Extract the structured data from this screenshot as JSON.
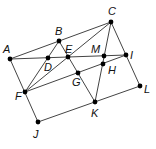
{
  "diagram": {
    "type": "geometric-figure",
    "points": [
      {
        "id": "A",
        "x": 10,
        "y": 59,
        "lx": 3,
        "ly": 53
      },
      {
        "id": "B",
        "x": 59,
        "y": 41,
        "lx": 55,
        "ly": 35
      },
      {
        "id": "C",
        "x": 111,
        "y": 22,
        "lx": 108,
        "ly": 15
      },
      {
        "id": "D",
        "x": 48,
        "y": 58,
        "lx": 44,
        "ly": 71
      },
      {
        "id": "E",
        "x": 68,
        "y": 57,
        "lx": 65,
        "ly": 53
      },
      {
        "id": "M",
        "x": 104,
        "y": 56,
        "lx": 91,
        "ly": 53
      },
      {
        "id": "I",
        "x": 126,
        "y": 55,
        "lx": 130,
        "ly": 59
      },
      {
        "id": "H",
        "x": 103,
        "y": 64,
        "lx": 108,
        "ly": 74
      },
      {
        "id": "G",
        "x": 78,
        "y": 73,
        "lx": 72,
        "ly": 86
      },
      {
        "id": "F",
        "x": 25,
        "y": 92,
        "lx": 15,
        "ly": 100
      },
      {
        "id": "J",
        "x": 38,
        "y": 122,
        "lx": 33,
        "ly": 138
      },
      {
        "id": "K",
        "x": 95,
        "y": 102,
        "lx": 91,
        "ly": 117
      },
      {
        "id": "L",
        "x": 140,
        "y": 86,
        "lx": 144,
        "ly": 93
      }
    ],
    "segments": [
      [
        "A",
        "C"
      ],
      [
        "A",
        "I"
      ],
      [
        "A",
        "J"
      ],
      [
        "J",
        "L"
      ],
      [
        "C",
        "L"
      ],
      [
        "F",
        "B"
      ],
      [
        "F",
        "C"
      ],
      [
        "F",
        "I"
      ],
      [
        "B",
        "K"
      ],
      [
        "C",
        "K"
      ]
    ],
    "colors": {
      "line": "#444444",
      "point": "#000000",
      "label": "#111111"
    }
  }
}
